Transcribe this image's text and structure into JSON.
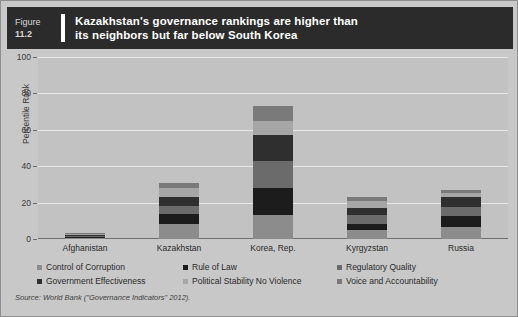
{
  "figure": {
    "label_word": "Figure",
    "number": "11.2",
    "title_line1": "Kazakhstan's governance rankings are higher than",
    "title_line2": "its neighbors but far below South Korea",
    "banner_bg": "#2b2b2b",
    "banner_text_color": "#ffffff"
  },
  "source_note": "Source: World Bank (\"Governance Indicators\" 2012).",
  "chart_data": {
    "type": "bar",
    "stacked": true,
    "title": "Kazakhstan's governance rankings are higher than its neighbors but far below South Korea",
    "xlabel": "",
    "ylabel": "Percentile Rank",
    "ylim": [
      0,
      100
    ],
    "yticks": [
      0,
      20,
      40,
      60,
      80,
      100
    ],
    "ytick_labels": [
      "0",
      "20",
      "40",
      "60",
      "80",
      "100"
    ],
    "grid": true,
    "grid_axis": "y",
    "legend_position": "bottom",
    "categories": [
      "Afghanistan",
      "Kazakhstan",
      "Korea, Rep.",
      "Kyrgyzstan",
      "Russia"
    ],
    "series": [
      {
        "name": "Control of Corruption",
        "color": "#8c8c8c",
        "values": [
          0.6,
          8.0,
          13.0,
          5.0,
          6.5
        ]
      },
      {
        "name": "Rule of Law",
        "color": "#1c1c1c",
        "values": [
          0.6,
          5.5,
          15.0,
          3.5,
          6.0
        ]
      },
      {
        "name": "Regulatory Quality",
        "color": "#6b6b6b",
        "values": [
          0.6,
          4.5,
          15.0,
          4.5,
          5.0
        ]
      },
      {
        "name": "Government Effectiveness",
        "color": "#2f2f2f",
        "values": [
          0.6,
          5.0,
          14.0,
          4.0,
          5.5
        ]
      },
      {
        "name": "Political Stability No Violence",
        "color": "#a6a6a6",
        "values": [
          0.6,
          5.0,
          8.0,
          4.0,
          2.5
        ]
      },
      {
        "name": "Voice and Accountability",
        "color": "#7a7a7a",
        "values": [
          0.6,
          3.0,
          8.0,
          2.0,
          1.5
        ]
      }
    ],
    "totals": [
      3.6,
      31.0,
      73.0,
      23.0,
      27.0
    ]
  },
  "colors": {
    "page_bg": "#c8c8c8",
    "plot_bg": "#c2c2c2",
    "gridline": "#e8e8e8",
    "axis": "#6e6e6e",
    "text": "#2a2a2a"
  }
}
